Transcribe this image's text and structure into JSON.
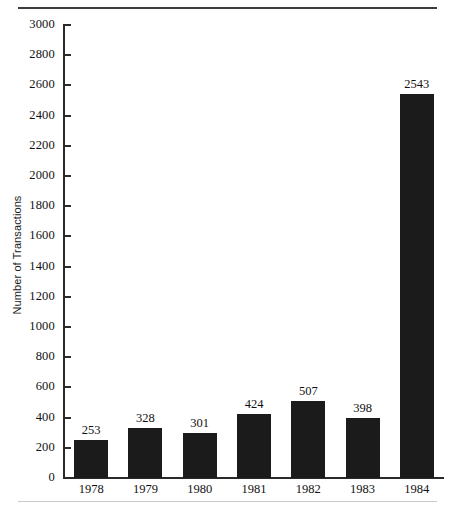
{
  "chart_data": {
    "type": "bar",
    "title": "",
    "subtitle": "",
    "xlabel": "",
    "ylabel": "Number of Transactions",
    "categories": [
      "1978",
      "1979",
      "1980",
      "1981",
      "1982",
      "1983",
      "1984"
    ],
    "values": [
      253,
      328,
      301,
      424,
      507,
      398,
      2543
    ],
    "value_labels": [
      "253",
      "328",
      "301",
      "424",
      "507",
      "398",
      "2543"
    ],
    "series": [
      {
        "name": "Number of Transactions",
        "values": [
          253,
          328,
          301,
          424,
          507,
          398,
          2543
        ]
      }
    ],
    "ylim": [
      0,
      3000
    ],
    "ytick_step": 200,
    "ytick_labels": [
      "3000",
      "2800",
      "2600",
      "2400",
      "2200",
      "2000",
      "1800",
      "1600",
      "1400",
      "1200",
      "1000",
      "800",
      "600",
      "400",
      "200",
      "0"
    ],
    "ytick_values": [
      3000,
      2800,
      2600,
      2400,
      2200,
      2000,
      1800,
      1600,
      1400,
      1200,
      1000,
      800,
      600,
      400,
      200,
      0
    ],
    "grid": false,
    "legend": false,
    "legend_position": "none",
    "bar_color": "#1b1b1b",
    "axis_color": "#2a2a2a",
    "background_color": "#ffffff",
    "data_labels_shown": true
  },
  "figure": {
    "rule_top_color": "#3c3c3c",
    "rule_bottom_color": "#c9c9c9"
  }
}
